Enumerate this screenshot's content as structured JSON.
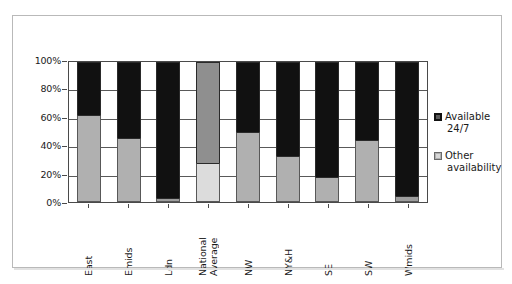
{
  "chart_data": {
    "type": "bar",
    "subtype": "stacked-100-percent",
    "title": "",
    "xlabel": "",
    "ylabel": "",
    "ylim": [
      0,
      100
    ],
    "ytick_labels": [
      "0%",
      "20%",
      "40%",
      "60%",
      "80%",
      "100%"
    ],
    "ytick_values": [
      0,
      20,
      40,
      60,
      80,
      100
    ],
    "grid": true,
    "legend_position": "right",
    "categories": [
      "East",
      "Emids",
      "Ldn",
      "National Average",
      "NW",
      "NY&H",
      "SE",
      "SW",
      "Wmids"
    ],
    "series": [
      {
        "name": "Available 24/7",
        "color": "#111111",
        "values": [
          38,
          54,
          97,
          72,
          50,
          67,
          82,
          56,
          96
        ]
      },
      {
        "name": "Other availability",
        "color": "#b0b0b0",
        "values": [
          62,
          46,
          3,
          28,
          50,
          33,
          18,
          44,
          4
        ]
      }
    ]
  },
  "chart": {
    "bars": [
      {
        "category": "East",
        "label_lines": "East",
        "other": 62,
        "available": 38,
        "top_color": "#111111",
        "bottom_color": "#b0b0b0"
      },
      {
        "category": "Emids",
        "label_lines": "Emids",
        "other": 46,
        "available": 54,
        "top_color": "#111111",
        "bottom_color": "#b0b0b0"
      },
      {
        "category": "Ldn",
        "label_lines": "Ldn",
        "other": 3,
        "available": 97,
        "top_color": "#111111",
        "bottom_color": "#9e9e9e"
      },
      {
        "category": "National Average",
        "label_lines": "National\nAverage",
        "other": 28,
        "available": 72,
        "top_color": "#8f8f8f",
        "bottom_color": "#dcdcdc"
      },
      {
        "category": "NW",
        "label_lines": "NW",
        "other": 50,
        "available": 50,
        "top_color": "#111111",
        "bottom_color": "#b0b0b0"
      },
      {
        "category": "NY&H",
        "label_lines": "NY&H",
        "other": 33,
        "available": 67,
        "top_color": "#111111",
        "bottom_color": "#b0b0b0"
      },
      {
        "category": "SE",
        "label_lines": "SE",
        "other": 18,
        "available": 82,
        "top_color": "#111111",
        "bottom_color": "#b0b0b0"
      },
      {
        "category": "SW",
        "label_lines": "SW",
        "other": 44,
        "available": 56,
        "top_color": "#111111",
        "bottom_color": "#b0b0b0"
      },
      {
        "category": "Wmids",
        "label_lines": "Wmids",
        "other": 4,
        "available": 96,
        "top_color": "#111111",
        "bottom_color": "#9e9e9e"
      }
    ],
    "y_ticks": [
      {
        "label": "100%",
        "value": 100
      },
      {
        "label": "80%",
        "value": 80
      },
      {
        "label": "60%",
        "value": 60
      },
      {
        "label": "40%",
        "value": 40
      },
      {
        "label": "20%",
        "value": 20
      },
      {
        "label": "0%",
        "value": 0
      }
    ],
    "legend": [
      {
        "label_line1": "Available",
        "label_line2": "24/7",
        "swatch": "black",
        "color": "#111111"
      },
      {
        "label_line1": "Other",
        "label_line2": "availability",
        "swatch": "gray",
        "color": "#b0b0b0"
      }
    ]
  }
}
